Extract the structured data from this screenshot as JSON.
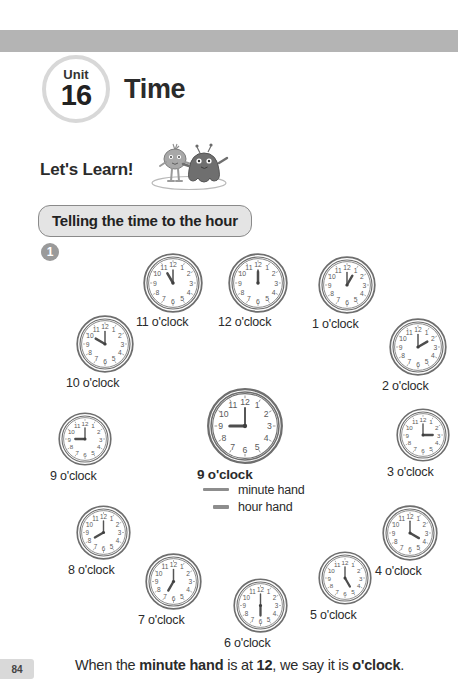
{
  "header": {
    "unit_word": "Unit",
    "unit_number": "16",
    "title": "Time"
  },
  "lets_learn": {
    "label": "Let's Learn!",
    "mascot_alt": "two-cartoon-monsters"
  },
  "section": {
    "heading": "Telling the time to the hour",
    "question_number": "1"
  },
  "legend": {
    "minute_hand": "minute hand",
    "hour_hand": "hour hand"
  },
  "footer": {
    "page_number": "84",
    "sentence_part1": "When the ",
    "sentence_bold1": "minute hand",
    "sentence_part2": " is at ",
    "sentence_bold2": "12",
    "sentence_part3": ", we say it is ",
    "sentence_bold3": "o'clock",
    "sentence_part4": "."
  },
  "colors": {
    "header_band": "#b4b4b4",
    "badge_ring": "#d8d8d8",
    "section_fill": "#e4e4e4",
    "section_border": "#8a8a8a",
    "clock_stroke": "#6e6e6e",
    "hand": "#555555",
    "page_tab": "#d9d9d9"
  },
  "clocks": [
    {
      "id": "clock-12",
      "label": "12 o'clock",
      "hour": 12,
      "minute": 0,
      "size": 60,
      "left": 228,
      "top": 253,
      "label_left": 218,
      "label_top": 313
    },
    {
      "id": "clock-1",
      "label": "1 o'clock",
      "hour": 1,
      "minute": 0,
      "size": 58,
      "left": 318,
      "top": 256,
      "label_left": 312,
      "label_top": 315
    },
    {
      "id": "clock-2",
      "label": "2 o'clock",
      "hour": 2,
      "minute": 0,
      "size": 58,
      "left": 389,
      "top": 318,
      "label_left": 382,
      "label_top": 377
    },
    {
      "id": "clock-3",
      "label": "3 o'clock",
      "hour": 3,
      "minute": 0,
      "size": 54,
      "left": 396,
      "top": 408,
      "label_left": 387,
      "label_top": 463
    },
    {
      "id": "clock-4",
      "label": "4 o'clock",
      "hour": 4,
      "minute": 0,
      "size": 56,
      "left": 382,
      "top": 505,
      "label_left": 375,
      "label_top": 562
    },
    {
      "id": "clock-5",
      "label": "5 o'clock",
      "hour": 5,
      "minute": 0,
      "size": 54,
      "left": 318,
      "top": 551,
      "label_left": 310,
      "label_top": 606
    },
    {
      "id": "clock-6",
      "label": "6 o'clock",
      "hour": 6,
      "minute": 0,
      "size": 55,
      "left": 233,
      "top": 578,
      "label_left": 224,
      "label_top": 634
    },
    {
      "id": "clock-7",
      "label": "7 o'clock",
      "hour": 7,
      "minute": 0,
      "size": 57,
      "left": 145,
      "top": 553,
      "label_left": 138,
      "label_top": 611
    },
    {
      "id": "clock-8",
      "label": "8 o'clock",
      "hour": 8,
      "minute": 0,
      "size": 55,
      "left": 76,
      "top": 505,
      "label_left": 68,
      "label_top": 561
    },
    {
      "id": "clock-9",
      "label": "9 o'clock",
      "hour": 9,
      "minute": 0,
      "size": 54,
      "left": 58,
      "top": 412,
      "label_left": 50,
      "label_top": 467
    },
    {
      "id": "clock-10",
      "label": "10 o'clock",
      "hour": 10,
      "minute": 0,
      "size": 58,
      "left": 76,
      "top": 315,
      "label_left": 66,
      "label_top": 374
    },
    {
      "id": "clock-11",
      "label": "11 o'clock",
      "hour": 11,
      "minute": 0,
      "size": 60,
      "left": 143,
      "top": 253,
      "label_left": 136,
      "label_top": 313
    }
  ],
  "center_clock": {
    "id": "clock-center",
    "label": "9 o'clock",
    "hour": 9,
    "minute": 0,
    "size": 76,
    "left": 207,
    "top": 388,
    "label_left": 197,
    "label_top": 465
  }
}
